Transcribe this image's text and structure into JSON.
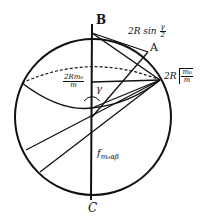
{
  "diagram": {
    "type": "geometry-sketch",
    "points": {
      "B": "B",
      "C": "C",
      "A": "A"
    },
    "labels": {
      "chord_BA": {
        "prefix": "2R sin",
        "num": "γ",
        "den": "2"
      },
      "radius_horizontal": {
        "prefix": "2R",
        "sqrt_num": "m₀",
        "sqrt_den": "m"
      },
      "horizontal_segment": {
        "prefix": "2R",
        "num": "m₀",
        "den": "m",
        "display_num": "2Rm₀",
        "display_den": "m"
      },
      "angle": "γ",
      "vertical_force": "f",
      "vertical_force_sub": "m₀αβ"
    },
    "colors": {
      "stroke": "#111111",
      "background": "#ffffff"
    }
  }
}
